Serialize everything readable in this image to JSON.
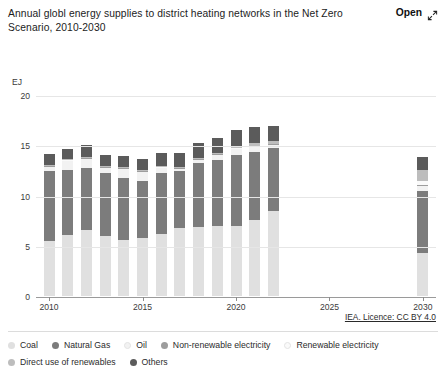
{
  "header": {
    "title": "Annual globl energy supplies to district heating networks in the Net Zero Scenario, 2010-2030",
    "open_label": "Open",
    "expand_icon": "expand-arrow-icon"
  },
  "footer": {
    "licence": "IEA. Licence: CC BY 4.0"
  },
  "chart_data": {
    "type": "bar",
    "stacked": true,
    "title": "Annual globl energy supplies to district heating networks in the Net Zero Scenario, 2010-2030",
    "xlabel": "",
    "ylabel": "EJ",
    "ylim": [
      0,
      20
    ],
    "yticks": [
      0,
      5,
      10,
      15,
      20
    ],
    "xlim": [
      2009.3,
      2030.7
    ],
    "xticks": [
      2010,
      2015,
      2020,
      2025,
      2030
    ],
    "grid": true,
    "legend_position": "bottom",
    "categories": [
      2010,
      2011,
      2012,
      2013,
      2014,
      2015,
      2016,
      2017,
      2018,
      2019,
      2020,
      2021,
      2022,
      2030
    ],
    "series": [
      {
        "name": "Coal",
        "color": "#e0e0e0",
        "values": [
          5.5,
          6.1,
          6.6,
          6.0,
          5.6,
          5.8,
          6.2,
          6.8,
          6.9,
          7.0,
          7.0,
          7.6,
          8.5,
          4.3
        ]
      },
      {
        "name": "Natural Gas",
        "color": "#7c7c7c",
        "values": [
          6.9,
          6.4,
          6.1,
          6.2,
          6.1,
          5.6,
          6.0,
          5.6,
          6.3,
          6.5,
          7.0,
          6.7,
          6.2,
          6.2
        ]
      },
      {
        "name": "Oil",
        "color": "#f2f2f2",
        "values": [
          0.45,
          0.9,
          0.95,
          0.55,
          0.95,
          0.95,
          0.5,
          0.25,
          0.35,
          0.55,
          0.6,
          0.55,
          0.35,
          0.4
        ]
      },
      {
        "name": "Non-renewable electricity",
        "color": "#9d9d9d",
        "values": [
          0.05,
          0.05,
          0.05,
          0.05,
          0.05,
          0.05,
          0.05,
          0.05,
          0.05,
          0.05,
          0.05,
          0.05,
          0.05,
          0.15
        ]
      },
      {
        "name": "Renewable electricity",
        "color": "#fafafa",
        "values": [
          0.05,
          0.05,
          0.05,
          0.05,
          0.05,
          0.05,
          0.05,
          0.05,
          0.05,
          0.05,
          0.05,
          0.05,
          0.05,
          0.35
        ]
      },
      {
        "name": "Direct use of renewables",
        "color": "#bdbdbd",
        "values": [
          0.1,
          0.1,
          0.1,
          0.1,
          0.1,
          0.1,
          0.1,
          0.1,
          0.1,
          0.1,
          0.25,
          0.3,
          0.3,
          1.1
        ]
      },
      {
        "name": "Others",
        "color": "#5b5b5b",
        "values": [
          1.1,
          1.0,
          1.2,
          1.1,
          1.1,
          1.1,
          1.3,
          1.4,
          1.5,
          1.5,
          1.6,
          1.6,
          1.5,
          1.3
        ]
      }
    ],
    "totals": [
      14.15,
      14.6,
      15.1,
      14.05,
      14.0,
      13.65,
      14.2,
      14.25,
      15.25,
      15.75,
      16.55,
      16.85,
      16.95,
      13.8
    ]
  },
  "legend": {
    "items": [
      {
        "label": "Coal",
        "color": "#e0e0e0"
      },
      {
        "label": "Natural Gas",
        "color": "#7c7c7c"
      },
      {
        "label": "Oil",
        "color": "#f2f2f2"
      },
      {
        "label": "Non-renewable electricity",
        "color": "#9d9d9d"
      },
      {
        "label": "Renewable electricity",
        "color": "#fafafa"
      },
      {
        "label": "Direct use of renewables",
        "color": "#bdbdbd"
      },
      {
        "label": "Others",
        "color": "#5b5b5b"
      }
    ]
  }
}
